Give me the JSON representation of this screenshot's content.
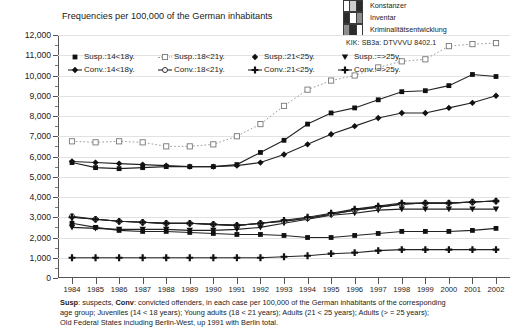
{
  "logo": {
    "line1": "Konstanzer",
    "line2": "Inventar",
    "line3": "Kriminalitätsentwicklung",
    "code": "KIK: SB3a: DTVVVU 8402.1"
  },
  "chart_title": "Frequencies per 100,000 of the German inhabitants",
  "footnote": {
    "lead1": "Susp",
    "text1": ": suspects,  ",
    "lead2": "Conv",
    "text2": ": convicted offenders, in each case per 100,000 of the German inhabitants of the corresponding",
    "line2": "age group; Juveniles (14 < 18 years); Young adults (18 < 21 years); Adults (21 < 25 years); Adults (> = 25 years);",
    "line3": "Old Federal States including Berlin-West, up 1991 with Berlin total."
  },
  "legend": [
    {
      "label": "Susp.:14<18y.",
      "marker": "filled-square",
      "line": "solid"
    },
    {
      "label": "Susp.:18<21y.",
      "marker": "open-square",
      "line": "dotted"
    },
    {
      "label": "Susp.:21<25y.",
      "marker": "filled-diamond",
      "line": "solid"
    },
    {
      "label": "Susp.:=>25y.",
      "marker": "filled-triangle-down",
      "line": "solid"
    },
    {
      "label": "Conv.:14<18y.",
      "marker": "filled-diamond",
      "line": "solid"
    },
    {
      "label": "Conv.:18<21y.",
      "marker": "open-circle",
      "line": "solid"
    },
    {
      "label": "Conv.:21<25y.",
      "marker": "filled-cross",
      "line": "solid"
    },
    {
      "label": "Conv.:=>25y.",
      "marker": "filled-cross",
      "line": "solid"
    }
  ],
  "chart_data": {
    "type": "line",
    "title": "Frequencies per 100,000 of the German inhabitants",
    "xlabel": "",
    "ylabel": "",
    "ylim": [
      0,
      12000
    ],
    "ytick_step": 1000,
    "grid": true,
    "legend_position": "top-inside",
    "categories": [
      1984,
      1985,
      1986,
      1987,
      1988,
      1989,
      1990,
      1991,
      1992,
      1993,
      1994,
      1995,
      1996,
      1997,
      1998,
      1999,
      2000,
      2001,
      2002
    ],
    "ytick_labels": [
      "0",
      "1,000",
      "2,000",
      "3,000",
      "4,000",
      "5,000",
      "6,000",
      "7,000",
      "8,000",
      "9,000",
      "10,000",
      "11,000",
      "12,000"
    ],
    "series": [
      {
        "name": "Susp.:14<18y.",
        "marker": "filled-square",
        "line": "solid",
        "values": [
          5700,
          5450,
          5400,
          5450,
          5500,
          5500,
          5500,
          5600,
          6200,
          6800,
          7600,
          8150,
          8400,
          8800,
          9200,
          9250,
          9500,
          10050,
          9950
        ]
      },
      {
        "name": "Susp.:18<21y.",
        "marker": "open-square",
        "line": "dotted",
        "values": [
          6750,
          6700,
          6750,
          6700,
          6500,
          6500,
          6600,
          7000,
          7600,
          8500,
          9300,
          9750,
          10000,
          10400,
          10700,
          10800,
          11450,
          11550,
          11600
        ]
      },
      {
        "name": "Susp.:21<25y.",
        "marker": "filled-diamond",
        "line": "solid",
        "values": [
          5750,
          5700,
          5650,
          5600,
          5550,
          5500,
          5500,
          5550,
          5700,
          6100,
          6600,
          7100,
          7500,
          7900,
          8150,
          8150,
          8400,
          8650,
          9000
        ]
      },
      {
        "name": "Susp.:=>25y.",
        "marker": "filled-triangle-down",
        "line": "solid",
        "values": [
          2500,
          2450,
          2400,
          2400,
          2400,
          2350,
          2350,
          2400,
          2500,
          2700,
          2900,
          3100,
          3200,
          3350,
          3400,
          3400,
          3400,
          3400,
          3400
        ]
      },
      {
        "name": "Conv.:14<18y.",
        "marker": "filled-diamond",
        "line": "solid",
        "values": [
          3000,
          2900,
          2800,
          2750,
          2700,
          2700,
          2650,
          2600,
          2700,
          2800,
          2950,
          3150,
          3350,
          3500,
          3650,
          3700,
          3700,
          3750,
          3800
        ]
      },
      {
        "name": "Conv.:18<21y.",
        "marker": "open-circle",
        "line": "solid",
        "values": [
          3050,
          2900,
          2800,
          2750,
          2700,
          2700,
          2650,
          2600,
          2700,
          2800,
          2950,
          3150,
          3350,
          3500,
          3650,
          3700,
          3700,
          3750,
          3800
        ]
      },
      {
        "name": "Conv.:21<25y.",
        "marker": "filled-cross",
        "line": "solid",
        "values": [
          3000,
          2900,
          2800,
          2750,
          2700,
          2700,
          2650,
          2600,
          2700,
          2850,
          3000,
          3200,
          3400,
          3550,
          3700,
          3700,
          3700,
          3750,
          3800
        ]
      },
      {
        "name": "Conv.:=>25y.",
        "marker": "filled-cross",
        "line": "solid",
        "values": [
          1000,
          1000,
          1000,
          1000,
          1000,
          1000,
          1000,
          1000,
          1000,
          1050,
          1100,
          1200,
          1250,
          1350,
          1400,
          1400,
          1400,
          1400,
          1400
        ]
      },
      {
        "name": "Conv.:14<18y.-lower",
        "marker": "filled-square",
        "line": "solid",
        "values": [
          2700,
          2500,
          2350,
          2300,
          2300,
          2250,
          2200,
          2150,
          2150,
          2100,
          2000,
          2000,
          2100,
          2200,
          2300,
          2300,
          2300,
          2350,
          2450
        ]
      }
    ]
  }
}
